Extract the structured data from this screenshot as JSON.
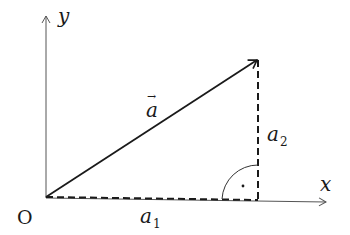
{
  "diagram": {
    "type": "vector-components",
    "colors": {
      "stroke": "#1a1a1a",
      "background": "#ffffff"
    },
    "origin": {
      "label": "O"
    },
    "axes": {
      "x": {
        "label": "x"
      },
      "y": {
        "label": "y"
      }
    },
    "vector": {
      "name": "a",
      "label": "a",
      "arrow": "→"
    },
    "components": {
      "horizontal": {
        "base": "a",
        "sub": "1"
      },
      "vertical": {
        "base": "a",
        "sub": "2"
      }
    },
    "right_angle_marker": {
      "symbol": "·"
    }
  }
}
